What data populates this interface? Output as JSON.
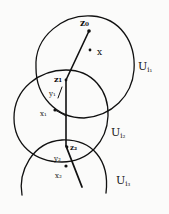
{
  "diagram": {
    "sets": [
      {
        "id": "U_i1",
        "label": "U",
        "sub": "i₁"
      },
      {
        "id": "U_i2",
        "label": "U",
        "sub": "i₂"
      },
      {
        "id": "U_i3",
        "label": "U",
        "sub": "i₃"
      }
    ],
    "points": {
      "z0": "z₀",
      "x": "x",
      "z1": "z₁",
      "y1": "y₁",
      "x1": "x₁",
      "z2": "z₂",
      "y2": "y₂",
      "x2": "x₂"
    },
    "colors": {
      "ink": "#111111",
      "paper": "#fbfbfa"
    }
  }
}
